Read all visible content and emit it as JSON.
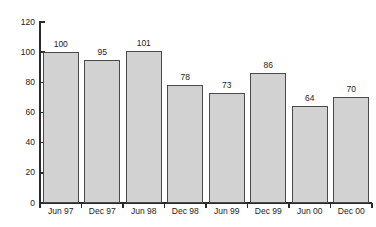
{
  "chart_data": {
    "type": "bar",
    "title": "",
    "subtitle": "",
    "xlabel": "",
    "ylabel": "",
    "categories": [
      "Jun 97",
      "Dec 97",
      "Jun 98",
      "Dec 98",
      "Jun 99",
      "Dec 99",
      "Jun 00",
      "Dec 00"
    ],
    "values": [
      100,
      95,
      101,
      78,
      73,
      86,
      64,
      70
    ],
    "data_labels": [
      "100",
      "95",
      "101",
      "78",
      "73",
      "86",
      "64",
      "70"
    ],
    "ylim": [
      0,
      120
    ],
    "yticks": [
      0,
      20,
      40,
      60,
      80,
      100,
      120
    ],
    "ytick_labels": [
      "0",
      "20",
      "40",
      "60",
      "80",
      "100",
      "120"
    ],
    "grid": false,
    "legend": false,
    "legend_position": "none",
    "bar_fill_color": "#d2d2d2",
    "bar_edge_color": "#4a4a4a",
    "axis_color": "#2a2a2a",
    "text_color": "#1c1c1c",
    "background_color": "#ffffff"
  }
}
